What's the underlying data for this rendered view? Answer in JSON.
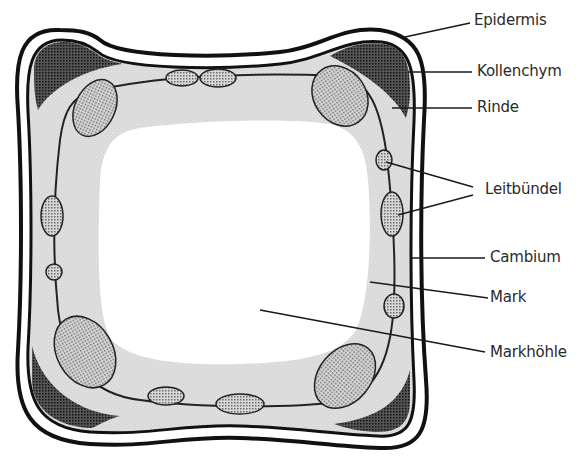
{
  "diagram": {
    "colors": {
      "outline": "#1a1a1a",
      "rinde_fill": "#dcdcdc",
      "kollenchym_fill": "#3a3a3a",
      "bundle_fill": "#bdbdbd",
      "background": "#ffffff",
      "label_text": "#2a2a2a"
    },
    "labels": [
      {
        "id": "epidermis",
        "text": "Epidermis"
      },
      {
        "id": "kollenchym",
        "text": "Kollenchym"
      },
      {
        "id": "rinde",
        "text": "Rinde"
      },
      {
        "id": "leitbuendel",
        "text": "Leitbündel"
      },
      {
        "id": "cambium",
        "text": "Cambium"
      },
      {
        "id": "mark",
        "text": "Mark"
      },
      {
        "id": "markhoehle",
        "text": "Markhöhle"
      }
    ]
  }
}
